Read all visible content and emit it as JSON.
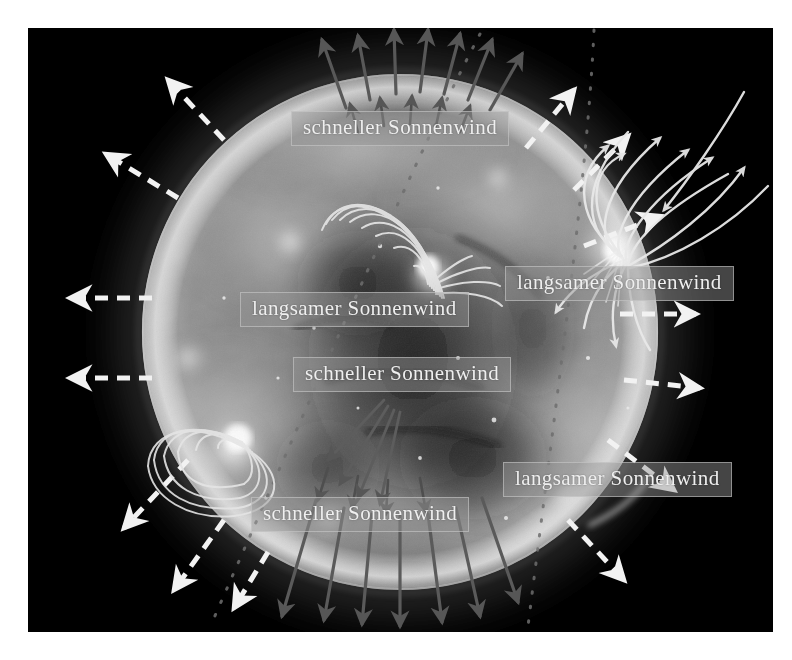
{
  "figure": {
    "kind": "solar-euv-image",
    "language": "de",
    "canvas": {
      "width": 792,
      "height": 660
    },
    "photo_frame": {
      "x": 28,
      "y": 28,
      "width": 745,
      "height": 604,
      "background": "#000000"
    },
    "sun": {
      "center_x": 400,
      "center_y": 332,
      "radius": 258
    },
    "colors": {
      "background": "#000000",
      "page": "#ffffff",
      "disk_mid": "#8a8a8a",
      "disk_bright": "#e8e8e8",
      "disk_dark": "#1a1a1a",
      "limb_glow": "#cfcfcf",
      "fast_wind_arrow": "#f2f2f2",
      "slow_wind_arrow": "#f2f2f2",
      "polar_arrow": "#5a5a5a",
      "field_line": "#e0e0e0",
      "dotted_line": "#6a6a6a",
      "label_background": "#969696",
      "label_border": "#cdcdcd",
      "label_text": "#efefef"
    }
  },
  "labels": [
    {
      "id": "fast-north",
      "text": "schneller Sonnenwind",
      "x": 291,
      "y": 111,
      "wind_type": "fast"
    },
    {
      "id": "slow-right-top",
      "text": "langsamer Sonnenwind",
      "x": 505,
      "y": 266,
      "wind_type": "slow"
    },
    {
      "id": "slow-center",
      "text": "langsamer Sonnenwind",
      "x": 240,
      "y": 292,
      "wind_type": "slow"
    },
    {
      "id": "fast-center",
      "text": "schneller Sonnenwind",
      "x": 293,
      "y": 357,
      "wind_type": "fast"
    },
    {
      "id": "slow-right-low",
      "text": "langsamer Sonnenwind",
      "x": 503,
      "y": 462,
      "wind_type": "slow"
    },
    {
      "id": "fast-south",
      "text": "schneller Sonnenwind",
      "x": 251,
      "y": 497,
      "wind_type": "fast"
    }
  ],
  "annotations": {
    "dashed_arrows_note": "white dashed radial arrows around the limb",
    "polar_arrows_note": "dark thin solid arrows over the north and south polar coronal holes",
    "field_lines_note": "bright closed magnetic loops over active regions and open lines at the east limb",
    "dotted_lines_note": "faint dotted great-circle lines crossing the field of view"
  }
}
